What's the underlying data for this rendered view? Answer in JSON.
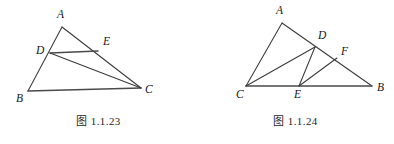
{
  "page": {
    "background_color": "#ffffff",
    "line_color": "#3a3a3a",
    "text_color": "#151515"
  },
  "figures": [
    {
      "id": "figure-1-1-23",
      "caption": "图 1.1.23",
      "description": "Triangle ABC with point D on side AB, point E on side AC, segment DE drawn and segment DC drawn.",
      "points": [
        {
          "name": "A",
          "label": "A",
          "x": 62,
          "y": 27,
          "label_x": 57,
          "label_y": 9
        },
        {
          "name": "B",
          "label": "B",
          "x": 28,
          "y": 91,
          "label_x": 16,
          "label_y": 93
        },
        {
          "name": "C",
          "label": "C",
          "x": 141,
          "y": 88,
          "label_x": 145,
          "label_y": 84
        },
        {
          "name": "D",
          "label": "D",
          "x": 50,
          "y": 53,
          "label_x": 36,
          "label_y": 45
        },
        {
          "name": "E",
          "label": "E",
          "x": 98,
          "y": 51,
          "label_x": 103,
          "label_y": 36
        }
      ],
      "segments": [
        {
          "name": "AB",
          "from": "A",
          "to": "B",
          "weight": "normal"
        },
        {
          "name": "AC",
          "from": "A",
          "to": "C",
          "weight": "normal"
        },
        {
          "name": "BC",
          "from": "B",
          "to": "C",
          "weight": "thick"
        },
        {
          "name": "DE",
          "from": "D",
          "to": "E",
          "weight": "thick"
        },
        {
          "name": "DC",
          "from": "D",
          "to": "C",
          "weight": "normal"
        }
      ]
    },
    {
      "id": "figure-1-1-24",
      "caption": "图 1.1.24",
      "description": "Triangle ABC with A at top, C at bottom left, B at bottom right. D and F lie on AB, E lies on CB. Segments CD, DE and EF are drawn.",
      "points": [
        {
          "name": "A",
          "label": "A",
          "x": 85,
          "y": 23,
          "label_x": 79,
          "label_y": 5
        },
        {
          "name": "B",
          "label": "B",
          "x": 175,
          "y": 86,
          "label_x": 180,
          "label_y": 82
        },
        {
          "name": "C",
          "label": "C",
          "x": 49,
          "y": 86,
          "label_x": 39,
          "label_y": 89
        },
        {
          "name": "D",
          "label": "D",
          "x": 118,
          "y": 47,
          "label_x": 121,
          "label_y": 30
        },
        {
          "name": "E",
          "label": "E",
          "x": 102,
          "y": 86,
          "label_x": 97,
          "label_y": 89
        },
        {
          "name": "F",
          "label": "F",
          "x": 140,
          "y": 58,
          "label_x": 144,
          "label_y": 46
        }
      ],
      "segments": [
        {
          "name": "AC",
          "from": "A",
          "to": "C",
          "weight": "normal"
        },
        {
          "name": "AB",
          "from": "A",
          "to": "B",
          "weight": "normal"
        },
        {
          "name": "CB",
          "from": "C",
          "to": "B",
          "weight": "thick"
        },
        {
          "name": "CD",
          "from": "C",
          "to": "D",
          "weight": "normal"
        },
        {
          "name": "DE",
          "from": "D",
          "to": "E",
          "weight": "normal"
        },
        {
          "name": "EF",
          "from": "E",
          "to": "F",
          "weight": "normal"
        }
      ]
    }
  ]
}
